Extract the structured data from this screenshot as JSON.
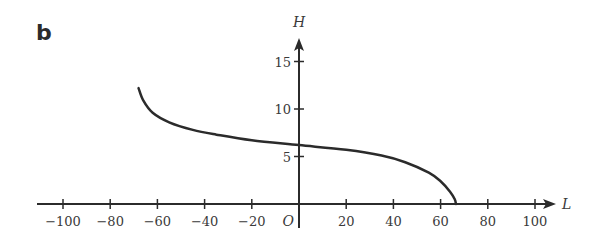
{
  "panel": {
    "label": "b"
  },
  "chart_data": {
    "type": "line",
    "title": "",
    "xlabel": "L",
    "ylabel": "H",
    "origin_label": "O",
    "xlim": [
      -110,
      110
    ],
    "ylim": [
      0,
      17
    ],
    "x_ticks": [
      -100,
      -80,
      -60,
      -40,
      -20,
      20,
      40,
      60,
      80,
      100
    ],
    "x_tick_labels": [
      "−100",
      "−80",
      "−60",
      "−40",
      "−20",
      "20",
      "40",
      "60",
      "80",
      "100"
    ],
    "y_ticks": [
      5,
      10,
      15
    ],
    "y_tick_labels": [
      "5",
      "10",
      "15"
    ],
    "grid": false,
    "legend": null,
    "series": [
      {
        "name": "H(L)",
        "color": "#2b2b2b",
        "x": [
          -68,
          -66,
          -62,
          -55,
          -45,
          -35,
          -20,
          0,
          20,
          35,
          45,
          55,
          60,
          64,
          66,
          66.5
        ],
        "y": [
          12.2,
          10.9,
          9.6,
          8.6,
          7.8,
          7.3,
          6.7,
          6.2,
          5.7,
          5.1,
          4.4,
          3.3,
          2.4,
          1.3,
          0.5,
          0
        ]
      }
    ]
  }
}
